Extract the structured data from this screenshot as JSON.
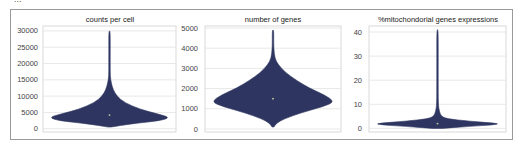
{
  "header": {
    "cut_off_text": "..."
  },
  "colors": {
    "violin_fill": "#2e3560",
    "grid": "#e2e2e2",
    "axis_frame": "#d0d0d0",
    "median": "#c8c8a0"
  },
  "chart_data": [
    {
      "type": "violin",
      "title": "counts per cell",
      "xlabel": "",
      "ylabel": "",
      "ylim": [
        -1000,
        31500
      ],
      "yticks": [
        0,
        5000,
        10000,
        15000,
        20000,
        25000,
        30000
      ],
      "ytick_labels": [
        "0",
        "5000",
        "10000",
        "15000",
        "20000",
        "25000",
        "30000"
      ],
      "grid": true,
      "distribution": {
        "min": 500,
        "mode": 3500,
        "median": 4200,
        "max": 30000
      },
      "profile": [
        [
          500,
          0.02
        ],
        [
          1500,
          0.35
        ],
        [
          2500,
          0.85
        ],
        [
          3500,
          1.0
        ],
        [
          4500,
          0.8
        ],
        [
          6000,
          0.5
        ],
        [
          8000,
          0.25
        ],
        [
          10000,
          0.12
        ],
        [
          12000,
          0.06
        ],
        [
          14000,
          0.03
        ],
        [
          16000,
          0.012
        ],
        [
          20000,
          0.008
        ],
        [
          25000,
          0.006
        ],
        [
          30000,
          0.004
        ]
      ]
    },
    {
      "type": "violin",
      "title": "number of genes",
      "xlabel": "",
      "ylabel": "",
      "ylim": [
        -150,
        5100
      ],
      "yticks": [
        0,
        1000,
        2000,
        3000,
        4000,
        5000
      ],
      "ytick_labels": [
        "0",
        "1000",
        "2000",
        "3000",
        "4000",
        "5000"
      ],
      "grid": true,
      "distribution": {
        "min": 100,
        "mode": 1350,
        "median": 1500,
        "max": 4900
      },
      "profile": [
        [
          100,
          0.015
        ],
        [
          300,
          0.06
        ],
        [
          500,
          0.18
        ],
        [
          800,
          0.45
        ],
        [
          1100,
          0.8
        ],
        [
          1350,
          1.0
        ],
        [
          1700,
          0.82
        ],
        [
          2000,
          0.6
        ],
        [
          2400,
          0.38
        ],
        [
          2800,
          0.2
        ],
        [
          3200,
          0.08
        ],
        [
          3500,
          0.03
        ],
        [
          4000,
          0.012
        ],
        [
          4500,
          0.008
        ],
        [
          4900,
          0.005
        ]
      ]
    },
    {
      "type": "violin",
      "title": "%mitochondorial genes expressions",
      "xlabel": "",
      "ylabel": "",
      "ylim": [
        -1.5,
        42.5
      ],
      "yticks": [
        0,
        10,
        20,
        30,
        40
      ],
      "ytick_labels": [
        "0",
        "10",
        "20",
        "30",
        "40"
      ],
      "grid": true,
      "distribution": {
        "min": 0,
        "mode": 2,
        "median": 2,
        "max": 41
      },
      "profile": [
        [
          0,
          0.08
        ],
        [
          0.8,
          0.5
        ],
        [
          1.5,
          0.9
        ],
        [
          2,
          1.0
        ],
        [
          3,
          0.5
        ],
        [
          4,
          0.15
        ],
        [
          5,
          0.06
        ],
        [
          7,
          0.03
        ],
        [
          10,
          0.012
        ],
        [
          20,
          0.008
        ],
        [
          30,
          0.006
        ],
        [
          41,
          0.004
        ]
      ]
    }
  ]
}
